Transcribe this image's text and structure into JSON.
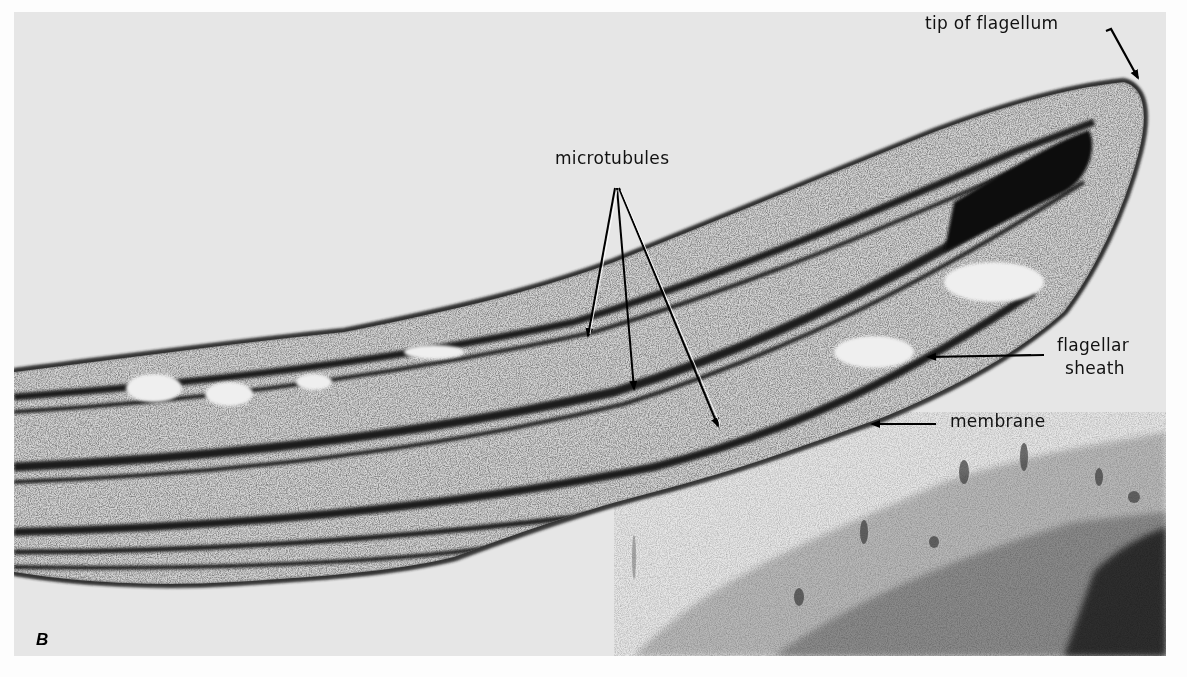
{
  "figure": {
    "panel_letter": "B",
    "labels": {
      "tip": "tip of flagellum",
      "microtubules": "microtubules",
      "sheath_line1": "flagellar",
      "sheath_line2": "sheath",
      "membrane": "membrane"
    },
    "colors": {
      "page_background": "#fdfdfd",
      "photo_background": "#e6e6e6",
      "dense_stain": "#1a1a1a",
      "label_text": "#111111"
    }
  }
}
